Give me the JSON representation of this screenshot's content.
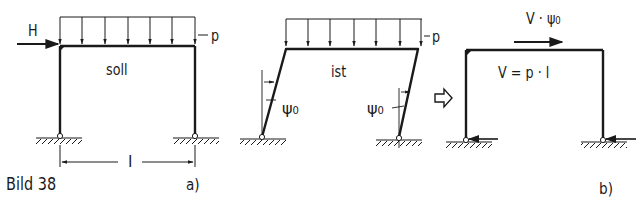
{
  "figure": {
    "caption": "Bild 38",
    "subfigures": [
      {
        "id": "a",
        "label": "a)",
        "frames": [
          {
            "name": "soll",
            "label": "soll",
            "load_label": "p",
            "horizontal_force_label": "H",
            "span_label": "l"
          },
          {
            "name": "ist",
            "label": "ist",
            "load_label": "p",
            "inclination_left": "ψ0",
            "inclination_right": "ψ0"
          }
        ],
        "implication_arrow": "⇨"
      },
      {
        "id": "b",
        "label": "b)",
        "frame": {
          "equation": "V = p · l",
          "equivalent_force_label": "V · ψ0"
        }
      }
    ]
  },
  "labels": {
    "caption": "Bild 38",
    "sub_a": "a)",
    "sub_b": "b)",
    "soll": "soll",
    "ist": "ist",
    "H": "H",
    "p": "p",
    "l": "l",
    "psi": "ψ",
    "psi_sub": "0",
    "eq": "V = p · l",
    "V_dot": "V · ψ",
    "V_dot_sub": "0"
  },
  "colors": {
    "ink": "#1a1a1a",
    "background": "#ffffff"
  }
}
